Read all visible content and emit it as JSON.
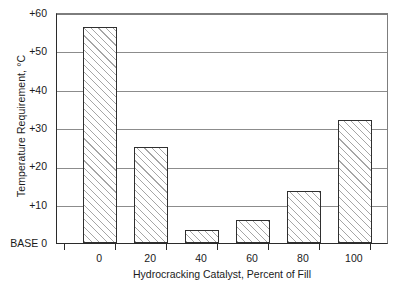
{
  "chart_data": {
    "type": "bar",
    "title": "",
    "subtitle": "",
    "xlabel": "Hydrocracking Catalyst, Percent of Fill",
    "ylabel": "Temperature Requirement, °C",
    "categories": [
      "0",
      "20",
      "40",
      "60",
      "80",
      "100"
    ],
    "values": [
      56,
      25,
      3.5,
      6,
      13.5,
      32
    ],
    "ylim": [
      0,
      60
    ],
    "yticks": [
      0,
      10,
      20,
      30,
      40,
      50,
      60
    ],
    "ytick_labels": [
      "BASE 0",
      "+10",
      "+20",
      "+30",
      "+40",
      "+50",
      "+60"
    ],
    "xtick_labels": [
      "0",
      "20",
      "40",
      "60",
      "80",
      "100"
    ],
    "grid": "horizontal",
    "legend": "none",
    "bar_fill": "diagonal-hatch",
    "colors": {
      "bar_edge": "#2f2f2f",
      "bar_fill": "#ffffff",
      "hatch": "#969696",
      "gridline": "#8c8c8c",
      "axis": "#2b2b2b",
      "text": "#1a1a1a",
      "background": "#ffffff"
    }
  }
}
